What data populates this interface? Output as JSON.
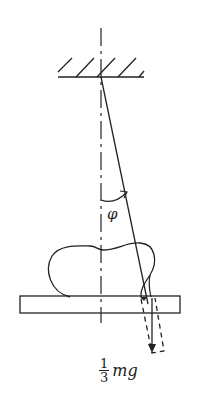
{
  "diagram": {
    "angle_label": "φ",
    "force_label": {
      "numerator": "1",
      "denominator": "3",
      "quantity": "mg"
    },
    "elements": {
      "ceiling": "hatched fixed support",
      "axis": "dashed vertical axis",
      "string": "line from pivot at angle phi",
      "body": "irregular blob resting on plate",
      "plate": "horizontal rectangle",
      "force_arrow": "downward arrow with dashed rectangle"
    },
    "colors": {
      "stroke": "#222222",
      "background": "#ffffff"
    }
  }
}
